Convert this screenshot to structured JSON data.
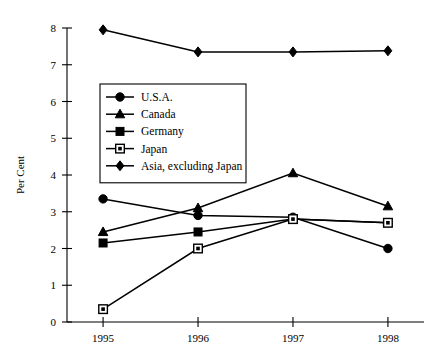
{
  "chart_data": {
    "type": "line",
    "title": "",
    "subtitle": "",
    "xlabel": "",
    "ylabel": "Per Cent",
    "categories": [
      "1995",
      "1996",
      "1997",
      "1998"
    ],
    "x": [
      1995,
      1996,
      1997,
      1998
    ],
    "xlim": [
      1994.62,
      1998.38
    ],
    "ylim": [
      0,
      8
    ],
    "yticks": [
      "0",
      "1",
      "2",
      "3",
      "4",
      "5",
      "6",
      "7",
      "8"
    ],
    "ytick_values": [
      0,
      1,
      2,
      3,
      4,
      5,
      6,
      7,
      8
    ],
    "grid": false,
    "legend_position": "upper-left-inside",
    "series": [
      {
        "name": "U.S.A.",
        "marker": "filled-circle",
        "values": [
          3.35,
          2.9,
          2.85,
          2.0
        ]
      },
      {
        "name": "Canada",
        "marker": "filled-triangle",
        "values": [
          2.45,
          3.1,
          4.05,
          3.15
        ]
      },
      {
        "name": "Germany",
        "marker": "filled-square",
        "values": [
          2.15,
          2.45,
          2.8,
          2.7
        ]
      },
      {
        "name": "Japan",
        "marker": "open-square",
        "values": [
          0.35,
          2.0,
          2.8,
          2.7
        ]
      },
      {
        "name": "Asia, excluding Japan",
        "marker": "filled-diamond",
        "values": [
          7.95,
          7.35,
          7.35,
          7.38
        ]
      }
    ]
  },
  "legend": {
    "items": [
      {
        "label": "U.S.A."
      },
      {
        "label": "Canada"
      },
      {
        "label": "Germany"
      },
      {
        "label": "Japan"
      },
      {
        "label": "Asia, excluding Japan"
      }
    ]
  },
  "axes": {
    "y_title": "Per Cent"
  }
}
